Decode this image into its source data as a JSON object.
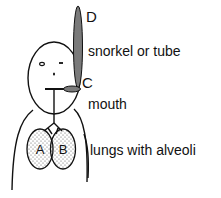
{
  "diagram": {
    "labels": {
      "tube_top": "D",
      "tube": "snorkel or tube",
      "tube_bottom": "C",
      "mouth": "mouth",
      "lungs": "lungs with alveoli"
    },
    "lungs": {
      "left": "A",
      "right": "B"
    },
    "colors": {
      "tube_fill": "#7a7a7a",
      "outline": "#111111",
      "alveoli_dots": "#555555"
    }
  }
}
